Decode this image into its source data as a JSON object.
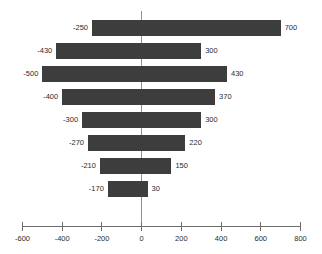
{
  "chart_data": {
    "type": "bar",
    "title": "",
    "subtitle": "",
    "xlabel": "",
    "ylabel": "",
    "orientation": "horizontal",
    "style": "tornado-diverging",
    "grid": false,
    "legend": null,
    "xlim": [
      -600,
      800
    ],
    "xticks": [
      -600,
      -400,
      -200,
      0,
      200,
      400,
      600,
      800
    ],
    "xtick_labels": [
      "-600",
      "-400",
      "-200",
      "0",
      "200",
      "400",
      "600",
      "800"
    ],
    "zero_reference": 0,
    "bar_color": "#3d3d3d",
    "axis_color": "#6e6e6e",
    "categories": [
      "1",
      "2",
      "3",
      "4",
      "5",
      "6",
      "7",
      "8"
    ],
    "series": [
      {
        "name": "negative",
        "values": [
          -250,
          -430,
          -500,
          -400,
          -300,
          -270,
          -210,
          -170
        ]
      },
      {
        "name": "positive",
        "values": [
          700,
          300,
          430,
          370,
          300,
          220,
          150,
          30
        ]
      }
    ],
    "bars": [
      {
        "low": -250,
        "high": 700,
        "low_label": "-250",
        "high_label": "700"
      },
      {
        "low": -430,
        "high": 300,
        "low_label": "-430",
        "high_label": "300"
      },
      {
        "low": -500,
        "high": 430,
        "low_label": "-500",
        "high_label": "430"
      },
      {
        "low": -400,
        "high": 370,
        "low_label": "-400",
        "high_label": "370"
      },
      {
        "low": -300,
        "high": 300,
        "low_label": "-300",
        "high_label": "300"
      },
      {
        "low": -270,
        "high": 220,
        "low_label": "-270",
        "high_label": "220"
      },
      {
        "low": -210,
        "high": 150,
        "low_label": "-210",
        "high_label": "150"
      },
      {
        "low": -170,
        "high": 30,
        "low_label": "-170",
        "high_label": "30"
      }
    ]
  }
}
